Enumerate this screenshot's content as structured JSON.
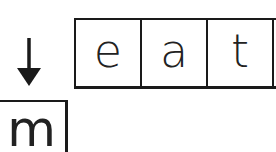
{
  "word": {
    "letters": [
      "e",
      "a",
      "t"
    ]
  },
  "replacement": {
    "letter": "m",
    "arrow_icon": "down-arrow"
  },
  "colors": {
    "ink": "#1a1a1a",
    "background": "#ffffff"
  }
}
